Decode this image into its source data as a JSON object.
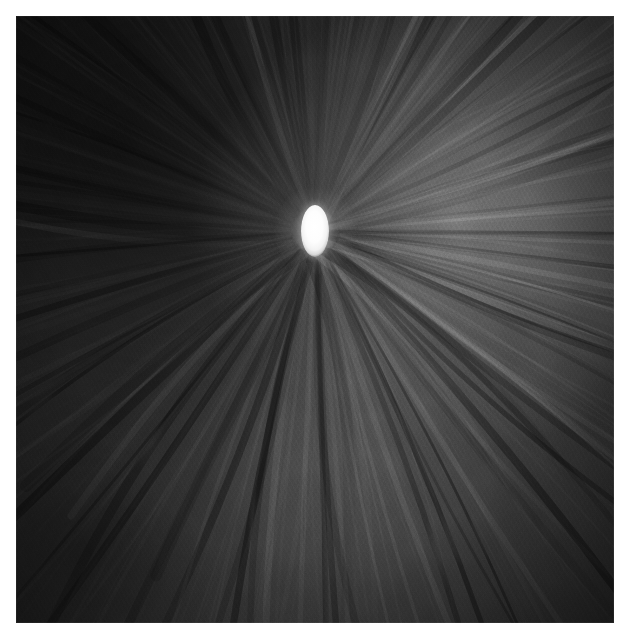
{
  "canvas": {
    "width": 629,
    "height": 639,
    "background_color": "#ffffff",
    "margin_px": 16
  },
  "plate": {
    "name": "optic-nerve-head-micrograph",
    "modality": "grayscale-micrograph",
    "x": 16,
    "y": 16,
    "width": 598,
    "height": 607,
    "colors": {
      "darkest": "#141414",
      "dark_background": "#262626",
      "mid_tone": "#3a3a3a",
      "bright_region": "#585858",
      "highlight": "#ffffff",
      "border": "#ffffff"
    },
    "description": "Dark grainy grayscale fundus-style micrograph of an optic nerve head with a bright white vertically elongated central disc and radiating nerve fibre striations"
  },
  "optic_disc": {
    "label": "optic-disc",
    "center_x_pct": 50.0,
    "center_y_pct": 35.4,
    "width_px": 28,
    "height_px": 52,
    "orientation": "vertical-ellipse",
    "fill_color": "#ffffff",
    "halo_color": "#ffffff"
  },
  "luminance_field": {
    "brightest_quadrant": "upper-right",
    "darkest_quadrant": "upper-left",
    "secondary_bright_region": "lower-center",
    "vignette": true
  },
  "texture": {
    "grain_opacity": 0.34,
    "striation_opacity": 0.3,
    "radial_rays_count": 72,
    "arcuate_bundles": 9
  },
  "accessibility": {
    "alt_text": "Grayscale micrograph of an optic nerve head: a small bright white vertical ellipse at the centre of a dark textured field with nerve fibre bundles radiating outward in a starburst pattern.",
    "title": "Optic nerve head micrograph"
  }
}
